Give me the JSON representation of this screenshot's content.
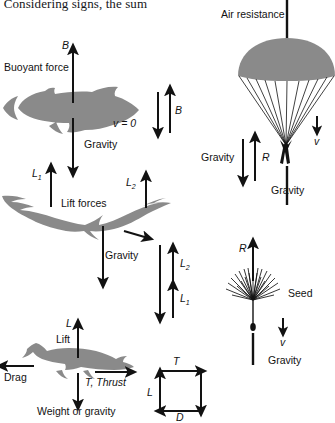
{
  "figure": {
    "top_running_text": ", Considering signs, the sum",
    "background_color": "#ffffff",
    "silhouette_color": "#8a8a8a",
    "ink_color": "#121212"
  },
  "panels": [
    {
      "id": "fish",
      "name": "buoyancy-fish",
      "subject": "fish",
      "labels": [
        {
          "name": "buoyant-force-label",
          "text": "Buoyant force"
        },
        {
          "name": "buoyant-force-symbol",
          "text": "B"
        },
        {
          "name": "gravity-label",
          "text": "Gravity"
        },
        {
          "name": "velocity-label",
          "text": "v = 0"
        },
        {
          "name": "balance-symbol",
          "text": "B"
        }
      ]
    },
    {
      "id": "bird",
      "name": "lift-forces-bird",
      "subject": "soaring bird",
      "labels": [
        {
          "name": "lift-forces-label",
          "text": "Lift forces"
        },
        {
          "name": "lift-one-symbol",
          "text": "L",
          "subscript": "1"
        },
        {
          "name": "lift-two-symbol",
          "text": "L",
          "subscript": "2"
        },
        {
          "name": "gravity-label",
          "text": "Gravity"
        },
        {
          "name": "lift-two-balance-symbol",
          "text": "L",
          "subscript": "2"
        },
        {
          "name": "lift-one-balance-symbol",
          "text": "L",
          "subscript": "1"
        }
      ]
    },
    {
      "id": "airplane",
      "name": "airplane-forces",
      "subject": "airplane",
      "labels": [
        {
          "name": "lift-symbol",
          "text": "L"
        },
        {
          "name": "lift-label",
          "text": "Lift"
        },
        {
          "name": "drag-label",
          "text": "Drag"
        },
        {
          "name": "thrust-label",
          "text": "T, Thrust"
        },
        {
          "name": "weight-label",
          "text": "Weight or gravity"
        }
      ]
    },
    {
      "id": "vector-loop",
      "name": "force-vector-loop",
      "subject": "closed vector polygon",
      "labels": [
        {
          "name": "thrust-symbol",
          "text": "T"
        },
        {
          "name": "lift-symbol",
          "text": "L"
        },
        {
          "name": "drag-symbol",
          "text": "D"
        }
      ]
    },
    {
      "id": "parachute",
      "name": "parachute-forces",
      "subject": "parachutist",
      "labels": [
        {
          "name": "air-resistance-label",
          "text": "Air resistance"
        },
        {
          "name": "velocity-symbol",
          "text": "v"
        },
        {
          "name": "gravity-left-label",
          "text": "Gravity"
        },
        {
          "name": "resistance-symbol",
          "text": "R"
        },
        {
          "name": "gravity-bottom-label",
          "text": "Gravity"
        }
      ]
    },
    {
      "id": "seed",
      "name": "seed-forces",
      "subject": "dandelion seed",
      "labels": [
        {
          "name": "resistance-symbol",
          "text": "R"
        },
        {
          "name": "seed-label",
          "text": "Seed"
        },
        {
          "name": "velocity-symbol",
          "text": "v"
        },
        {
          "name": "gravity-label",
          "text": "Gravity"
        }
      ]
    }
  ]
}
